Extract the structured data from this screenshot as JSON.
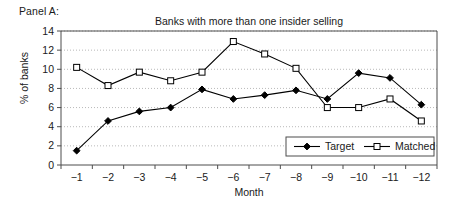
{
  "panel": {
    "label": "Panel A:"
  },
  "chart_data": {
    "type": "line",
    "title": "Banks with more than one insider selling",
    "xlabel": "Month",
    "ylabel": "% of banks",
    "categories": [
      "-1",
      "-2",
      "-3",
      "-4",
      "-5",
      "-6",
      "-7",
      "-8",
      "-9",
      "-10",
      "-11",
      "-12"
    ],
    "ylim": [
      0,
      14
    ],
    "ytick_step": 2,
    "yticks": [
      "0",
      "2",
      "4",
      "6",
      "8",
      "10",
      "12",
      "14"
    ],
    "grid": "horizontal-dotted",
    "legend_position": "bottom-right",
    "series": [
      {
        "name": "Target",
        "marker": "filled-diamond",
        "color": "#000000",
        "values": [
          1.5,
          4.6,
          5.6,
          6.0,
          7.9,
          6.9,
          7.3,
          7.8,
          6.9,
          9.6,
          9.1,
          6.3
        ]
      },
      {
        "name": "Matched",
        "marker": "open-square",
        "color": "#000000",
        "values": [
          10.2,
          8.3,
          9.7,
          8.8,
          9.7,
          12.9,
          11.6,
          10.1,
          6.0,
          6.0,
          6.9,
          4.6
        ]
      }
    ]
  }
}
